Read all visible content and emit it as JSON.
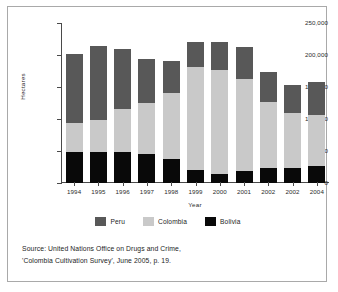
{
  "chart_data": {
    "type": "bar",
    "stacked": true,
    "title": "",
    "xlabel": "Year",
    "ylabel": "Hectares",
    "ylim": [
      0,
      250000
    ],
    "ytick_labels": [
      "250,000",
      "200,000",
      "150,000",
      "100,000",
      "50,000",
      "0"
    ],
    "ytick_values": [
      250000,
      200000,
      150000,
      100000,
      50000,
      0
    ],
    "grid": false,
    "legend_position": "bottom",
    "categories": [
      "1994",
      "1995",
      "1996",
      "1997",
      "1998",
      "1999",
      "2000",
      "2001",
      "2002",
      "2002",
      "2004"
    ],
    "series": [
      {
        "name": "Bolivia",
        "color": "#090909",
        "values": [
          48000,
          48000,
          48000,
          46000,
          38000,
          21000,
          14000,
          19000,
          24000,
          23000,
          27000
        ]
      },
      {
        "name": "Colombia",
        "color": "#c9c9c9",
        "values": [
          45000,
          51000,
          67000,
          79000,
          102000,
          160000,
          163000,
          144000,
          102000,
          86000,
          80000
        ]
      },
      {
        "name": "Peru",
        "color": "#585858",
        "values": [
          108000,
          115000,
          94000,
          69000,
          51000,
          39000,
          44000,
          49000,
          47000,
          44000,
          51000
        ]
      }
    ],
    "totals": [
      201000,
      214000,
      209000,
      194000,
      191000,
      220000,
      221000,
      212000,
      173000,
      153000,
      158000
    ],
    "stack_order_bottom_to_top": [
      "Bolivia",
      "Colombia",
      "Peru"
    ]
  },
  "legend": {
    "items": [
      {
        "label": "Peru",
        "color": "#585858"
      },
      {
        "label": "Colombia",
        "color": "#c9c9c9"
      },
      {
        "label": "Bolivia",
        "color": "#090909"
      }
    ]
  },
  "source": {
    "line1": "Source: United Nations Office on Drugs and Crime,",
    "line2": "'Colombia Cultivation Survey', June 2005, p. 19."
  }
}
